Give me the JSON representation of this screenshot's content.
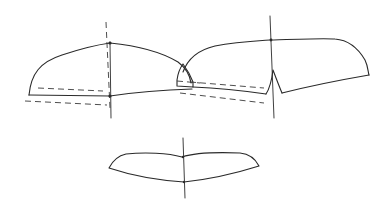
{
  "diagram": {
    "background": "#ffffff",
    "line_color": "#2a2a2a",
    "figures": [
      {
        "name": "left-pattern-piece",
        "outline": "M29,95 C33,70 45,55 110,43 C150,48 175,55 186,72 L192,88 L110,96 Z",
        "center_line": {
          "x1": 107,
          "y1": 22,
          "x2": 110,
          "y2": 118
        },
        "center_dashed": {
          "x1": 106,
          "y1": 22,
          "x2": 110,
          "y2": 108
        },
        "dashed_lines": [
          "M38,88 L103,91",
          "M25,101 L107,105"
        ],
        "points": [
          [
            110,
            43
          ],
          [
            110,
            96
          ]
        ]
      },
      {
        "name": "overlap-tab",
        "outline": "M176,86 L176,78 Q178,66 183,64 M176,86 L192,87 L192,80"
      },
      {
        "name": "right-pattern-piece",
        "outline": "M183,72 C190,52 210,42 270,40 C320,38 340,38 355,44 C375,55 365,74 368,75 L281,93 C284,84 278,72 272,72 C274,80 268,92 266,94 L190,85",
        "center_line": {
          "x1": 270,
          "y1": 16,
          "x2": 274,
          "y2": 118
        },
        "dashed_lines": [
          "M180,81 L264,88",
          "M180,92 L264,103"
        ],
        "points": [
          [
            270,
            40
          ]
        ]
      },
      {
        "name": "sleeve-piece",
        "outline": "M109,168 C112,160 118,155 125,154 C150,153 170,154 182,157 C195,154 210,153 240,153 C250,155 256,162 258,166 C240,172 215,180 183,182 C155,180 130,175 109,168 Z",
        "center_line": {
          "x1": 183,
          "y1": 138,
          "x2": 185,
          "y2": 198
        },
        "points": [
          [
            183,
            157
          ],
          [
            183,
            182
          ]
        ]
      }
    ],
    "text_labels": []
  }
}
